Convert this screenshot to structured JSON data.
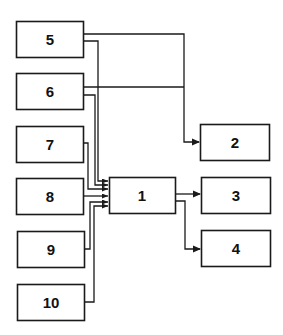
{
  "diagram": {
    "type": "block-diagram",
    "blocks": [
      {
        "id": "1",
        "label": "1"
      },
      {
        "id": "2",
        "label": "2"
      },
      {
        "id": "3",
        "label": "3"
      },
      {
        "id": "4",
        "label": "4"
      },
      {
        "id": "5",
        "label": "5"
      },
      {
        "id": "6",
        "label": "6"
      },
      {
        "id": "7",
        "label": "7"
      },
      {
        "id": "8",
        "label": "8"
      },
      {
        "id": "9",
        "label": "9"
      },
      {
        "id": "10",
        "label": "10"
      }
    ],
    "connections": [
      {
        "from": "5",
        "to": "2"
      },
      {
        "from": "6",
        "to": "2"
      },
      {
        "from": "5",
        "to": "1"
      },
      {
        "from": "6",
        "to": "1"
      },
      {
        "from": "7",
        "to": "1"
      },
      {
        "from": "8",
        "to": "1"
      },
      {
        "from": "9",
        "to": "1"
      },
      {
        "from": "10",
        "to": "1"
      },
      {
        "from": "1",
        "to": "3"
      },
      {
        "from": "1",
        "to": "4"
      }
    ]
  }
}
